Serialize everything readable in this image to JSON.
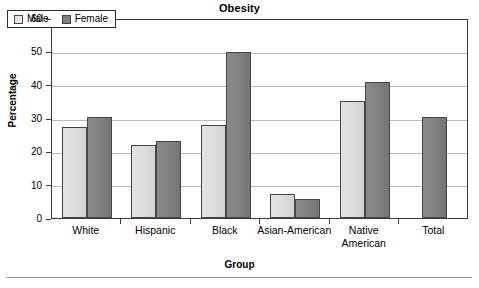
{
  "chart_data": {
    "type": "bar",
    "title": "Obesity",
    "xlabel": "Group",
    "ylabel": "Percentage",
    "categories": [
      "White",
      "Hispanic",
      "Black",
      "Asian-American",
      "Native American",
      "Total"
    ],
    "category_lines": [
      [
        "White"
      ],
      [
        "Hispanic"
      ],
      [
        "Black"
      ],
      [
        "Asian-American"
      ],
      [
        "Native",
        "American"
      ],
      [
        "Total"
      ]
    ],
    "series": [
      {
        "name": "Male",
        "color": "#dcdcdc",
        "values": [
          27.3,
          21.9,
          28.0,
          7.1,
          35.2,
          null
        ]
      },
      {
        "name": "Female",
        "color": "#808080",
        "values": [
          30.2,
          23.2,
          49.8,
          5.8,
          40.8,
          30.3
        ]
      }
    ],
    "ylim": [
      0,
      60
    ],
    "ytick_labels": [
      "0",
      "10",
      "20",
      "30",
      "40",
      "50",
      "60"
    ],
    "ytick_values": [
      0,
      10,
      20,
      30,
      40,
      50,
      60
    ],
    "grid": true,
    "grid_axis": "y",
    "legend_position": "top-left-inside",
    "legend_entries": [
      "Male",
      "Female"
    ]
  },
  "legend": {
    "male_label": "Male",
    "female_label": "Female"
  }
}
